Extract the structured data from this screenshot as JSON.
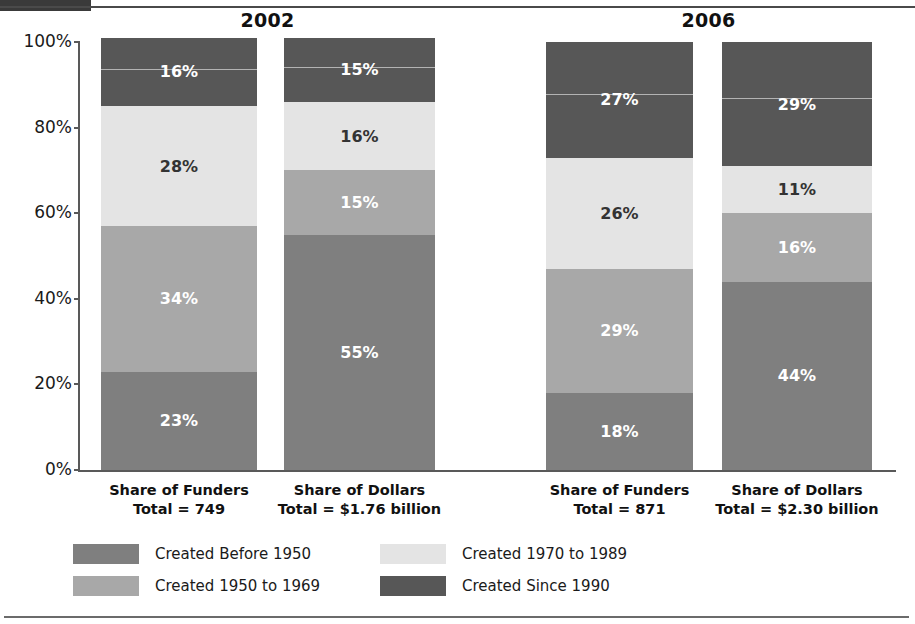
{
  "chart_data": {
    "type": "bar",
    "subtype": "stacked-bar-100pct",
    "title": "",
    "xlabel": "",
    "ylabel": "",
    "ylim": [
      0,
      100
    ],
    "ytick_labels": [
      "100%",
      "80%",
      "60%",
      "40%",
      "20%",
      "0%"
    ],
    "ytick_values": [
      100,
      80,
      60,
      40,
      20,
      0
    ],
    "grid": false,
    "legend_position": "bottom",
    "groups": [
      "2002",
      "2006"
    ],
    "categories": [
      "Share of Funders\nTotal = 749",
      "Share of Dollars\nTotal = $1.76 billion",
      "Share of Funders\nTotal = 871",
      "Share of Dollars\nTotal = $2.30 billion"
    ],
    "series": [
      {
        "name": "Created Before 1950",
        "color": "#7f7f7f",
        "values": [
          23,
          55,
          18,
          44
        ]
      },
      {
        "name": "Created 1950 to 1969",
        "color": "#a8a8a8",
        "values": [
          34,
          15,
          29,
          16
        ]
      },
      {
        "name": "Created 1970 to 1989",
        "color": "#e4e4e4",
        "values": [
          28,
          16,
          26,
          11
        ]
      },
      {
        "name": "Created Since 1990",
        "color": "#575757",
        "values": [
          16,
          15,
          27,
          29
        ]
      }
    ]
  },
  "top_bar": {
    "label": ""
  },
  "groups": [
    {
      "title": "2002"
    },
    {
      "title": "2006"
    }
  ],
  "yaxis": {
    "ticks": [
      {
        "label": "100%"
      },
      {
        "label": "80%"
      },
      {
        "label": "60%"
      },
      {
        "label": "40%"
      },
      {
        "label": "20%"
      },
      {
        "label": "0%"
      }
    ]
  },
  "bars": [
    {
      "name": "2002-share-of-funders",
      "caption_line1": "Share of Funders",
      "caption_line2": "Total = 749",
      "segments": [
        {
          "label": "23%",
          "series": "Created Before 1950",
          "value": 23,
          "color": "#7f7f7f",
          "text_color": "#ffffff"
        },
        {
          "label": "34%",
          "series": "Created 1950 to 1969",
          "value": 34,
          "color": "#a8a8a8",
          "text_color": "#ffffff"
        },
        {
          "label": "28%",
          "series": "Created 1970 to 1989",
          "value": 28,
          "color": "#e4e4e4",
          "text_color": "#333333"
        },
        {
          "label": "16%",
          "series": "Created Since 1990",
          "value": 16,
          "color": "#575757",
          "text_color": "#ffffff"
        }
      ]
    },
    {
      "name": "2002-share-of-dollars",
      "caption_line1": "Share of Dollars",
      "caption_line2": "Total = $1.76 billion",
      "segments": [
        {
          "label": "55%",
          "series": "Created Before 1950",
          "value": 55,
          "color": "#7f7f7f",
          "text_color": "#ffffff"
        },
        {
          "label": "15%",
          "series": "Created 1950 to 1969",
          "value": 15,
          "color": "#a8a8a8",
          "text_color": "#ffffff"
        },
        {
          "label": "16%",
          "series": "Created 1970 to 1989",
          "value": 16,
          "color": "#e4e4e4",
          "text_color": "#333333"
        },
        {
          "label": "15%",
          "series": "Created Since 1990",
          "value": 15,
          "color": "#575757",
          "text_color": "#ffffff"
        }
      ]
    },
    {
      "name": "2006-share-of-funders",
      "caption_line1": "Share of Funders",
      "caption_line2": "Total = 871",
      "segments": [
        {
          "label": "18%",
          "series": "Created Before 1950",
          "value": 18,
          "color": "#7f7f7f",
          "text_color": "#ffffff"
        },
        {
          "label": "29%",
          "series": "Created 1950 to 1969",
          "value": 29,
          "color": "#a8a8a8",
          "text_color": "#ffffff"
        },
        {
          "label": "26%",
          "series": "Created 1970 to 1989",
          "value": 26,
          "color": "#e4e4e4",
          "text_color": "#333333"
        },
        {
          "label": "27%",
          "series": "Created Since 1990",
          "value": 27,
          "color": "#575757",
          "text_color": "#ffffff"
        }
      ]
    },
    {
      "name": "2006-share-of-dollars",
      "caption_line1": "Share of Dollars",
      "caption_line2": "Total = $2.30 billion",
      "segments": [
        {
          "label": "44%",
          "series": "Created Before 1950",
          "value": 44,
          "color": "#7f7f7f",
          "text_color": "#ffffff"
        },
        {
          "label": "16%",
          "series": "Created 1950 to 1969",
          "value": 16,
          "color": "#a8a8a8",
          "text_color": "#ffffff"
        },
        {
          "label": "11%",
          "series": "Created 1970 to 1989",
          "value": 11,
          "color": "#e4e4e4",
          "text_color": "#333333"
        },
        {
          "label": "29%",
          "series": "Created Since 1990",
          "value": 29,
          "color": "#575757",
          "text_color": "#ffffff"
        }
      ]
    }
  ],
  "legend": {
    "items": [
      {
        "label": "Created Before 1950",
        "color": "#7f7f7f"
      },
      {
        "label": "Created 1950 to 1969",
        "color": "#a8a8a8"
      },
      {
        "label": "Created 1970 to 1989",
        "color": "#e4e4e4"
      },
      {
        "label": "Created Since 1990",
        "color": "#575757"
      }
    ]
  },
  "colors": {
    "before_1950": "#7f7f7f",
    "y1950_1969": "#a8a8a8",
    "y1970_1989": "#e4e4e4",
    "since_1990": "#575757",
    "axis": "#595959",
    "rule": "#4a4a4a"
  }
}
